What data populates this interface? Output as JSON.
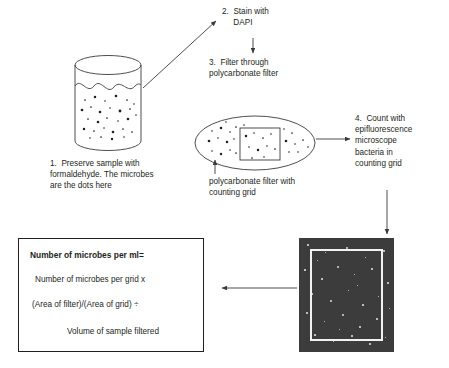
{
  "figure": {
    "type": "process-flow-diagram"
  },
  "steps": {
    "step1": {
      "lines": [
        "1.  Preserve sample with",
        "formaldehyde. The microbes",
        "are the dots here"
      ]
    },
    "step2": {
      "lines": [
        "2.  Stain with",
        "     DAPI"
      ]
    },
    "step3": {
      "lines": [
        "3.  Filter through",
        "polycarbonate filter"
      ]
    },
    "step4": {
      "lines": [
        "4.  Count with",
        "epifluorescence",
        "microscope",
        "bacteria in",
        "counting grid"
      ]
    }
  },
  "captions": {
    "filter": {
      "lines": [
        "polycarbonate filter with",
        "counting grid"
      ]
    }
  },
  "formula": {
    "title": "Number of microbes per ml=",
    "line1": "Number of microbes per grid x",
    "line2": "(Area of filter)/(Area of grid) ÷",
    "line3": "Volume of sample filtered"
  },
  "colors": {
    "ink": "#231f20",
    "line": "#3a3a3a",
    "micrograph_field": "#3c3c3c",
    "micrograph_frame": "#f2f2f2",
    "speck": "#d8d8d0",
    "background": "#ffffff"
  },
  "diagram_elements": {
    "beaker": "beaker-with-sample-and-microbe-dots",
    "filter": "ellipse-polycarbonate-filter-with-rectangular-counting-grid",
    "micrograph": "dark-epifluorescence-micrograph-with-white-counting-grid-square",
    "arrows": [
      "beaker-to-step2-diagonal",
      "step2-to-step3-down",
      "filter-caption-to-filter-up",
      "filter-to-step4-right",
      "step4-to-micrograph-down",
      "micrograph-to-formula-left"
    ]
  }
}
